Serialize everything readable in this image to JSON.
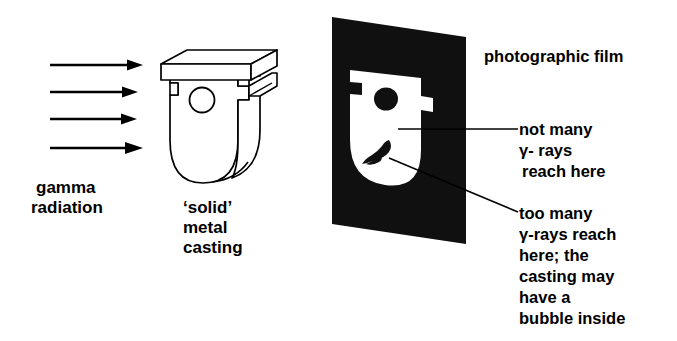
{
  "figure": {
    "title_text": "",
    "colors": {
      "ink": "#000000",
      "paper": "#ffffff",
      "film_black": "#101010"
    }
  },
  "source": {
    "label_line1": "gamma",
    "label_line2": "radiation",
    "beam": {
      "arrow_count": 4,
      "direction": "left-to-right"
    }
  },
  "specimen": {
    "caption_line1": "‘solid’",
    "caption_line2": "metal",
    "caption_line3": "casting",
    "features": {
      "hole_label": "through-hole",
      "flange_label": "top-flange",
      "notch_label": "side-notch"
    }
  },
  "film": {
    "label": "photographic film"
  },
  "annotations": [
    {
      "id": "low-exposure",
      "line1": "not many",
      "line2": "γ- rays",
      "line3": "reach here"
    },
    {
      "id": "high-exposure",
      "line1": "too many",
      "line2": "γ-rays reach",
      "line3": "here; the",
      "line4": "casting may",
      "line5": "have a",
      "line6": "bubble inside"
    }
  ]
}
